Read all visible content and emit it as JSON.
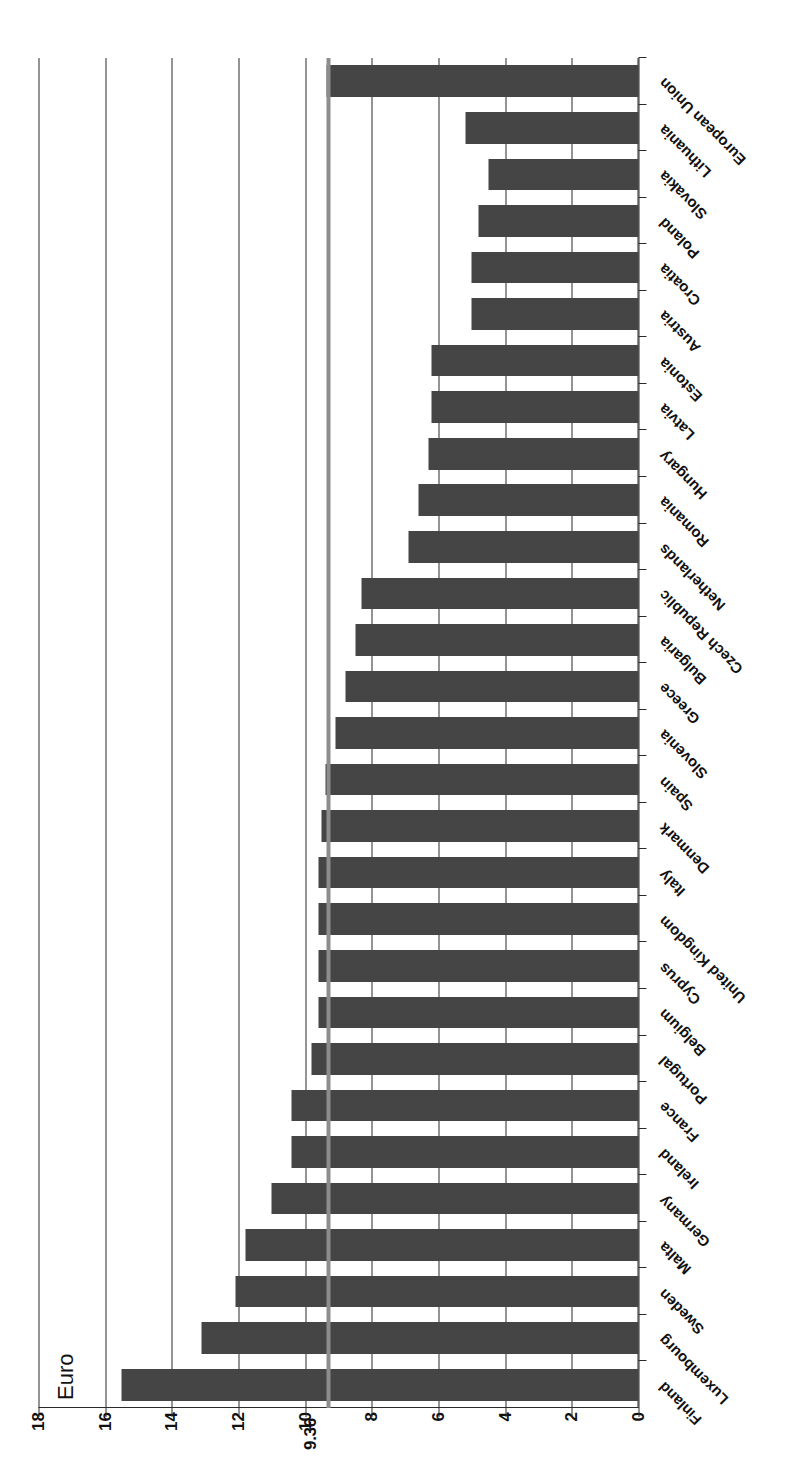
{
  "chart_data": {
    "type": "bar",
    "orientation": "horizontal",
    "title": "",
    "xlabel": "",
    "ylabel": "Euro",
    "value_axis_label": "Euro",
    "ylim": [
      0,
      18
    ],
    "ticks": [
      "0",
      "2",
      "4",
      "6",
      "8",
      "10",
      "12",
      "14",
      "16",
      "18"
    ],
    "tick_values": [
      0,
      2,
      4,
      6,
      8,
      10,
      12,
      14,
      16,
      18
    ],
    "grid": true,
    "legend": false,
    "bar_color": "#454545",
    "reference_line": {
      "label": "9.36",
      "value": 9.36,
      "color": "#8d8d8d"
    },
    "categories": [
      "Finland",
      "Luxembourg",
      "Sweden",
      "Malta",
      "Germany",
      "Ireland",
      "France",
      "Portugal",
      "Belgium",
      "Cyprus",
      "United Kingdom",
      "Italy",
      "Denmark",
      "Spain",
      "Slovenia",
      "Greece",
      "Bulgaria",
      "Czech Republic",
      "Netherlands",
      "Romania",
      "Hungary",
      "Latvia",
      "Estonia",
      "Austria",
      "Croatia",
      "Poland",
      "Slovakia",
      "Lithuania",
      "European Union"
    ],
    "values": [
      15.5,
      13.1,
      12.1,
      11.8,
      11.0,
      10.4,
      10.4,
      9.8,
      9.6,
      9.6,
      9.6,
      9.6,
      9.5,
      9.4,
      9.1,
      8.8,
      8.5,
      8.3,
      6.9,
      6.6,
      6.3,
      6.2,
      6.2,
      5.0,
      5.0,
      4.8,
      4.5,
      5.2,
      9.36
    ]
  }
}
